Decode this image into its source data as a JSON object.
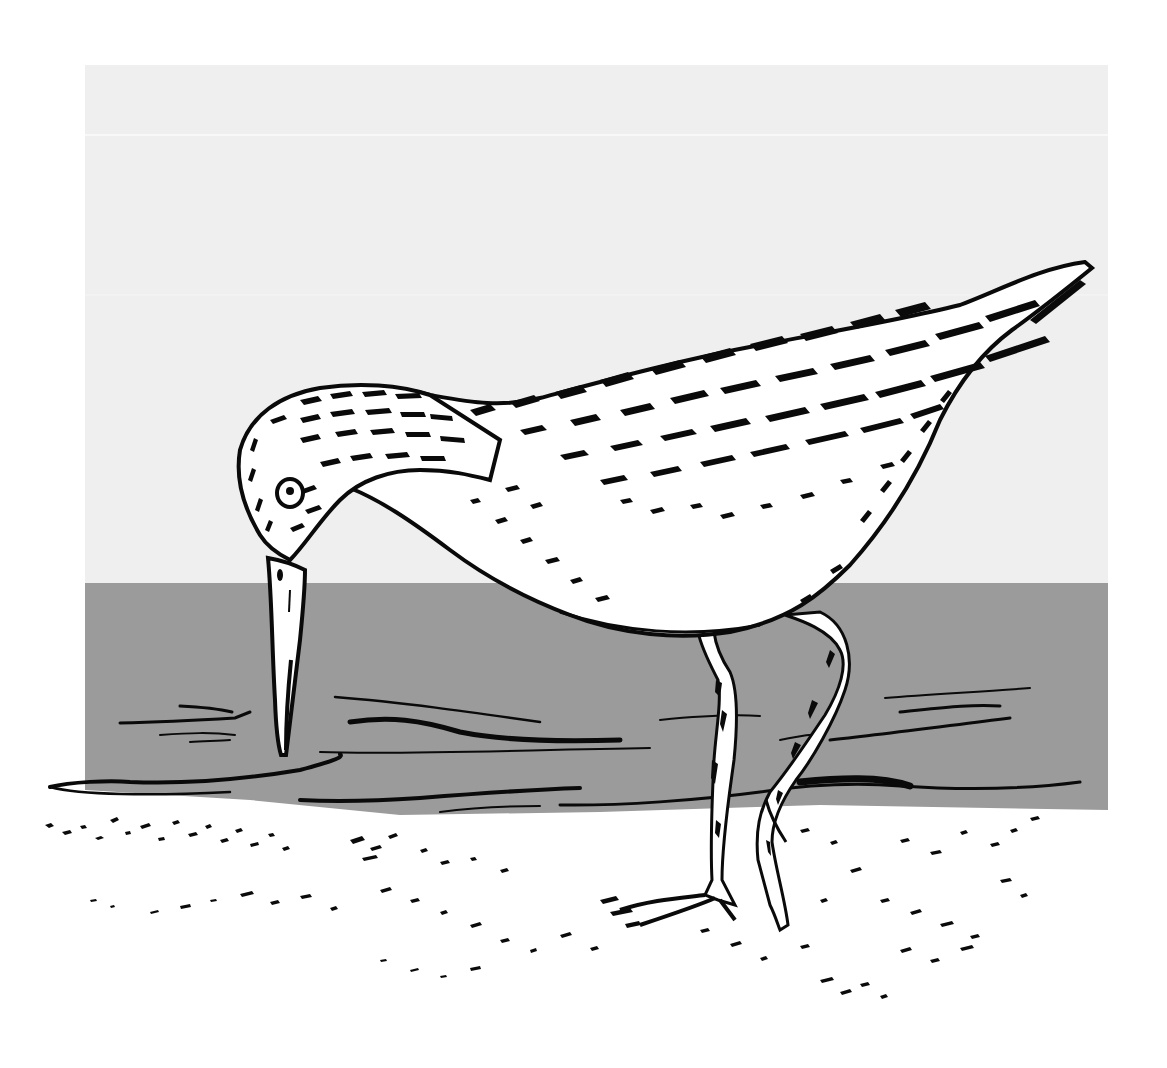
{
  "illustration": {
    "subject": "Sandpiper (shorebird) probing mud with long bill",
    "style": "black pen-and-ink line drawing on flat gray panels",
    "colors": {
      "page_background": "#ffffff",
      "sky_panel": "#efefef",
      "water_band": "#9b9b9b",
      "ink": "#0a0a0a",
      "bird_fill": "#ffffff"
    },
    "regions": {
      "sky": {
        "x": 85,
        "y": 65,
        "width": 1023,
        "height": 518
      },
      "water": {
        "x": 85,
        "y": 583,
        "width": 1023,
        "height": 227
      },
      "sand": {
        "y_start": 790,
        "y_end": 1010
      }
    }
  }
}
